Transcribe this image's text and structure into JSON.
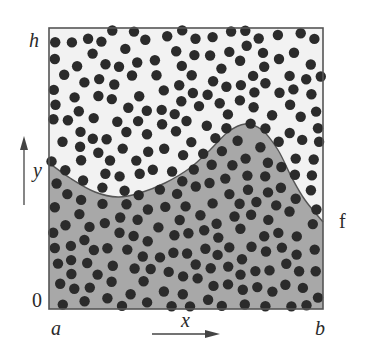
{
  "figure": {
    "labels": {
      "y_top": "h",
      "y_bottom": "0",
      "x_left": "a",
      "x_right": "b",
      "x_axis": "x",
      "y_axis": "y",
      "curve": "f"
    },
    "colors": {
      "background_above": "#f2f2f2",
      "area_under_curve": "#a8a8a8",
      "points": "#2b2b2b",
      "frame": "#555555",
      "curve": "#555555"
    },
    "box": {
      "x0": 49,
      "y0": 28,
      "x1": 323,
      "y1": 309
    },
    "curve_points": [
      [
        49,
        163
      ],
      [
        70,
        178
      ],
      [
        95,
        192
      ],
      [
        118,
        197
      ],
      [
        140,
        193
      ],
      [
        165,
        183
      ],
      [
        190,
        168
      ],
      [
        210,
        150
      ],
      [
        228,
        132
      ],
      [
        245,
        124
      ],
      [
        262,
        130
      ],
      [
        278,
        150
      ],
      [
        292,
        178
      ],
      [
        305,
        200
      ],
      [
        323,
        222
      ]
    ],
    "point_radius": 5.2,
    "point_count_approx": 360
  }
}
